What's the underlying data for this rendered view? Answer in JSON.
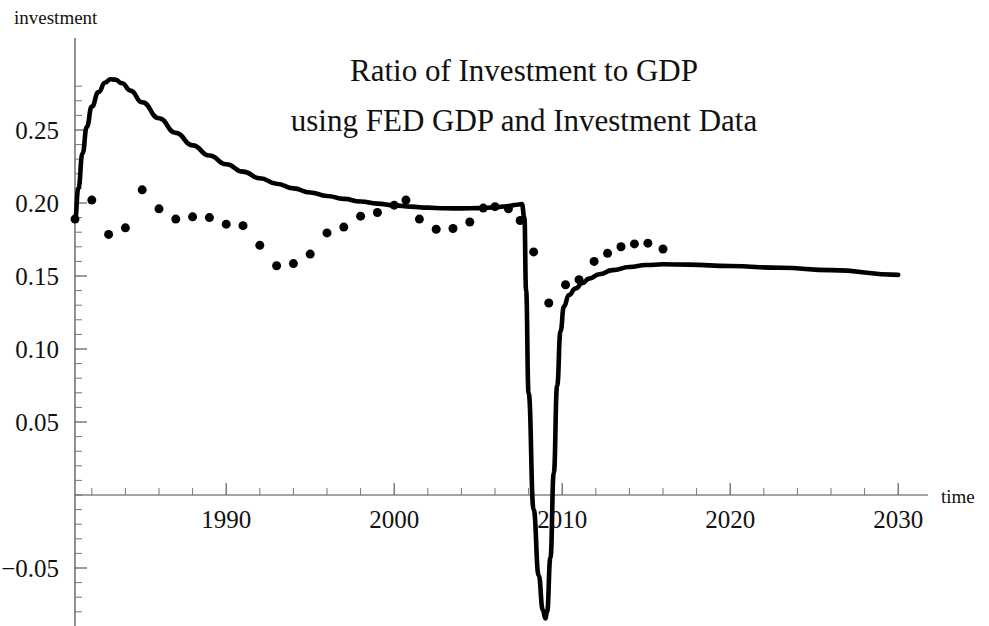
{
  "chart_data": {
    "type": "line",
    "title": "Ratio of Investment to GDP",
    "subtitle": "using FED GDP and Investment Data",
    "xlabel": "time",
    "ylabel": "investment",
    "xlim": [
      1980.5,
      2031.5
    ],
    "ylim": [
      -0.085,
      0.3
    ],
    "grid": false,
    "legend": "none",
    "xticks": [
      1990,
      2000,
      2010,
      2020,
      2030
    ],
    "xtick_labels": [
      "1990",
      "2000",
      "2010",
      "2020",
      "2030"
    ],
    "xtick_minor_step": 2,
    "yticks": [
      0.25,
      0.2,
      0.15,
      0.1,
      0.05,
      -0.05
    ],
    "ytick_labels": [
      "0.25",
      "0.20",
      "0.15",
      "0.10",
      "0.05",
      "−0.05"
    ],
    "ytick_minor_step": 0.01,
    "series": [
      {
        "name": "model curve",
        "type": "line",
        "color": "#000000",
        "points": [
          [
            1981.0,
            0.1885
          ],
          [
            1981.2,
            0.21
          ],
          [
            1981.45,
            0.234
          ],
          [
            1981.7,
            0.252
          ],
          [
            1982.0,
            0.266
          ],
          [
            1982.4,
            0.276
          ],
          [
            1982.8,
            0.2825
          ],
          [
            1983.1,
            0.2848
          ],
          [
            1983.4,
            0.2845
          ],
          [
            1983.8,
            0.282
          ],
          [
            1984.3,
            0.277
          ],
          [
            1985.0,
            0.269
          ],
          [
            1986.0,
            0.258
          ],
          [
            1987.0,
            0.248
          ],
          [
            1988.0,
            0.2395
          ],
          [
            1989.0,
            0.2325
          ],
          [
            1990.0,
            0.2265
          ],
          [
            1991.0,
            0.2215
          ],
          [
            1992.0,
            0.217
          ],
          [
            1993.0,
            0.2132
          ],
          [
            1994.0,
            0.21
          ],
          [
            1995.0,
            0.2072
          ],
          [
            1996.0,
            0.2048
          ],
          [
            1997.0,
            0.2028
          ],
          [
            1998.0,
            0.201
          ],
          [
            1999.0,
            0.1996
          ],
          [
            2000.0,
            0.1984
          ],
          [
            2001.0,
            0.1975
          ],
          [
            2002.0,
            0.1968
          ],
          [
            2003.0,
            0.1964
          ],
          [
            2004.0,
            0.1963
          ],
          [
            2005.0,
            0.1965
          ],
          [
            2006.0,
            0.197
          ],
          [
            2006.7,
            0.1978
          ],
          [
            2007.3,
            0.1988
          ],
          [
            2007.6,
            0.1993
          ],
          [
            2007.75,
            0.19
          ],
          [
            2007.85,
            0.14
          ],
          [
            2008.0,
            0.07
          ],
          [
            2008.3,
            -0.01
          ],
          [
            2008.6,
            -0.055
          ],
          [
            2008.85,
            -0.079
          ],
          [
            2009.0,
            -0.0845
          ],
          [
            2009.1,
            -0.08
          ],
          [
            2009.3,
            -0.043
          ],
          [
            2009.5,
            0.015
          ],
          [
            2009.7,
            0.075
          ],
          [
            2009.9,
            0.112
          ],
          [
            2010.1,
            0.129
          ],
          [
            2010.4,
            0.137
          ],
          [
            2010.8,
            0.1415
          ],
          [
            2011.2,
            0.1452
          ],
          [
            2011.6,
            0.1482
          ],
          [
            2012.2,
            0.1512
          ],
          [
            2013.0,
            0.154
          ],
          [
            2014.0,
            0.1562
          ],
          [
            2015.0,
            0.1575
          ],
          [
            2016.0,
            0.158
          ],
          [
            2017.5,
            0.1578
          ],
          [
            2020.0,
            0.1568
          ],
          [
            2023.0,
            0.1556
          ],
          [
            2026.0,
            0.154
          ],
          [
            2030.0,
            0.1508
          ]
        ]
      },
      {
        "name": "FED data points",
        "type": "scatter",
        "color": "#000000",
        "marker_size": 9,
        "points": [
          [
            1981.0,
            0.189
          ],
          [
            1982.0,
            0.202
          ],
          [
            1983.0,
            0.1785
          ],
          [
            1984.0,
            0.183
          ],
          [
            1985.0,
            0.209
          ],
          [
            1986.0,
            0.196
          ],
          [
            1987.0,
            0.189
          ],
          [
            1988.0,
            0.1905
          ],
          [
            1989.0,
            0.19
          ],
          [
            1990.0,
            0.1855
          ],
          [
            1991.0,
            0.1845
          ],
          [
            1992.0,
            0.171
          ],
          [
            1993.0,
            0.157
          ],
          [
            1994.0,
            0.1585
          ],
          [
            1995.0,
            0.165
          ],
          [
            1996.0,
            0.1795
          ],
          [
            1997.0,
            0.1835
          ],
          [
            1998.0,
            0.191
          ],
          [
            1999.0,
            0.1935
          ],
          [
            2000.0,
            0.1985
          ],
          [
            2000.7,
            0.202
          ],
          [
            2001.5,
            0.189
          ],
          [
            2002.5,
            0.182
          ],
          [
            2003.5,
            0.1825
          ],
          [
            2004.5,
            0.187
          ],
          [
            2005.3,
            0.1965
          ],
          [
            2006.0,
            0.1975
          ],
          [
            2006.8,
            0.196
          ],
          [
            2007.5,
            0.188
          ],
          [
            2008.3,
            0.1665
          ],
          [
            2009.2,
            0.1315
          ],
          [
            2010.2,
            0.144
          ],
          [
            2011.0,
            0.1475
          ],
          [
            2011.9,
            0.16
          ],
          [
            2012.7,
            0.1655
          ],
          [
            2013.5,
            0.17
          ],
          [
            2014.3,
            0.172
          ],
          [
            2015.1,
            0.1725
          ],
          [
            2016.0,
            0.1685
          ]
        ]
      }
    ]
  }
}
